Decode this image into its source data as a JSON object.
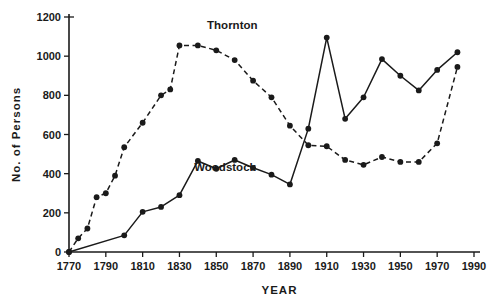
{
  "chart_data": {
    "type": "line",
    "title": "",
    "xlabel": "YEAR",
    "ylabel": "No. of Persons",
    "xlim": [
      1770,
      1990
    ],
    "ylim": [
      0,
      1200
    ],
    "xticks": [
      1770,
      1790,
      1810,
      1830,
      1850,
      1870,
      1890,
      1910,
      1930,
      1950,
      1970,
      1990
    ],
    "yticks": [
      0,
      200,
      400,
      600,
      800,
      1000,
      1200
    ],
    "grid": false,
    "legend_position": "inline-annotation",
    "series": [
      {
        "name": "Thornton",
        "style": "dashed",
        "marker": "filled-circle",
        "label_x": 1845,
        "label_y": 1140,
        "points": [
          {
            "x": 1770,
            "y": 0
          },
          {
            "x": 1775,
            "y": 70
          },
          {
            "x": 1780,
            "y": 120
          },
          {
            "x": 1785,
            "y": 280
          },
          {
            "x": 1790,
            "y": 300
          },
          {
            "x": 1795,
            "y": 390
          },
          {
            "x": 1800,
            "y": 535
          },
          {
            "x": 1810,
            "y": 660
          },
          {
            "x": 1820,
            "y": 800
          },
          {
            "x": 1825,
            "y": 830
          },
          {
            "x": 1830,
            "y": 1055
          },
          {
            "x": 1840,
            "y": 1055
          },
          {
            "x": 1850,
            "y": 1030
          },
          {
            "x": 1860,
            "y": 980
          },
          {
            "x": 1870,
            "y": 875
          },
          {
            "x": 1880,
            "y": 790
          },
          {
            "x": 1890,
            "y": 645
          },
          {
            "x": 1900,
            "y": 545
          },
          {
            "x": 1910,
            "y": 540
          },
          {
            "x": 1920,
            "y": 470
          },
          {
            "x": 1930,
            "y": 445
          },
          {
            "x": 1940,
            "y": 485
          },
          {
            "x": 1950,
            "y": 460
          },
          {
            "x": 1960,
            "y": 460
          },
          {
            "x": 1970,
            "y": 555
          },
          {
            "x": 1981,
            "y": 945
          }
        ]
      },
      {
        "name": "Woodstock",
        "style": "solid",
        "marker": "filled-circle",
        "label_x": 1838,
        "label_y": 415,
        "points": [
          {
            "x": 1770,
            "y": 0
          },
          {
            "x": 1800,
            "y": 85
          },
          {
            "x": 1810,
            "y": 205
          },
          {
            "x": 1820,
            "y": 230
          },
          {
            "x": 1830,
            "y": 290
          },
          {
            "x": 1840,
            "y": 465
          },
          {
            "x": 1850,
            "y": 425
          },
          {
            "x": 1860,
            "y": 470
          },
          {
            "x": 1870,
            "y": 430
          },
          {
            "x": 1880,
            "y": 395
          },
          {
            "x": 1890,
            "y": 345
          },
          {
            "x": 1900,
            "y": 630
          },
          {
            "x": 1910,
            "y": 1095
          },
          {
            "x": 1920,
            "y": 680
          },
          {
            "x": 1930,
            "y": 790
          },
          {
            "x": 1940,
            "y": 985
          },
          {
            "x": 1950,
            "y": 900
          },
          {
            "x": 1960,
            "y": 825
          },
          {
            "x": 1970,
            "y": 930
          },
          {
            "x": 1981,
            "y": 1020
          }
        ]
      }
    ]
  },
  "axis": {
    "y_title": "No. of Persons",
    "x_title": "YEAR",
    "y_tick_labels": [
      "1200",
      "1000",
      "800",
      "600",
      "400",
      "200",
      "0"
    ],
    "x_tick_labels": [
      "1770",
      "1790",
      "1810",
      "1830",
      "1850",
      "1870",
      "1890",
      "1910",
      "1930",
      "1950",
      "1970",
      "1990"
    ]
  },
  "annotations": {
    "thornton_label": "Thornton",
    "woodstock_label": "Woodstock"
  },
  "colors": {
    "ink": "#1a1a1a",
    "background": "#ffffff"
  }
}
